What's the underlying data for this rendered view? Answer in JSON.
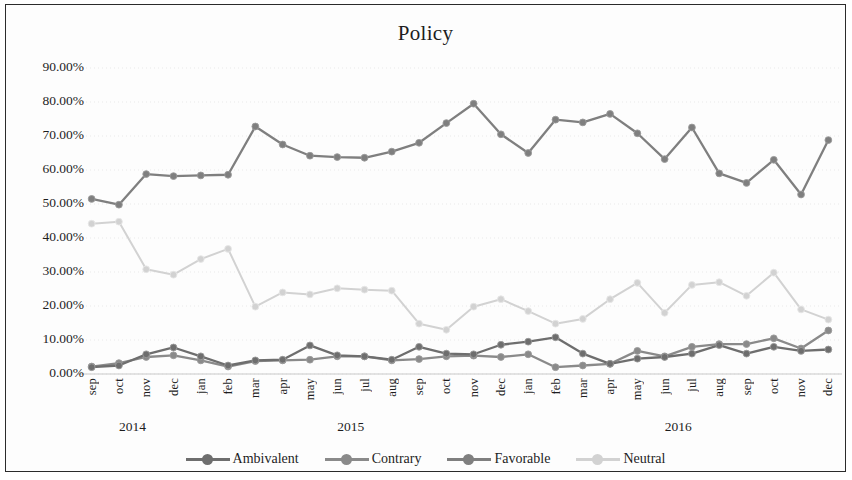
{
  "chart_data": {
    "type": "line",
    "title": "Policy",
    "xlabel": "",
    "ylabel": "",
    "ylim": [
      0,
      90
    ],
    "ytick_labels": [
      "90.00%",
      "80.00%",
      "70.00%",
      "60.00%",
      "50.00%",
      "40.00%",
      "30.00%",
      "20.00%",
      "10.00%",
      "0.00%"
    ],
    "ytick_values": [
      90,
      80,
      70,
      60,
      50,
      40,
      30,
      20,
      10,
      0
    ],
    "grid": true,
    "legend_position": "bottom",
    "categories": [
      "sep",
      "oct",
      "nov",
      "dec",
      "jan",
      "feb",
      "mar",
      "apr",
      "may",
      "jun",
      "jul",
      "aug",
      "sep",
      "oct",
      "nov",
      "dec",
      "jan",
      "feb",
      "mar",
      "apr",
      "may",
      "jun",
      "jul",
      "aug",
      "sep",
      "oct",
      "nov",
      "dec"
    ],
    "year_groups": [
      {
        "label": "2014",
        "start_index": 0,
        "end_index": 3
      },
      {
        "label": "2015",
        "start_index": 4,
        "end_index": 15
      },
      {
        "label": "2016",
        "start_index": 16,
        "end_index": 27
      }
    ],
    "series": [
      {
        "name": "Ambivalent",
        "color": "#6e6e6e",
        "values": [
          2.0,
          2.5,
          5.8,
          7.8,
          5.2,
          2.5,
          4.0,
          4.2,
          8.4,
          5.5,
          5.2,
          4.2,
          8.0,
          6.0,
          5.8,
          8.6,
          9.5,
          10.8,
          6.0,
          3.0,
          4.5,
          5.0,
          6.0,
          8.5,
          6.0,
          8.0,
          6.8,
          7.2
        ]
      },
      {
        "name": "Contrary",
        "color": "#8a8a8a",
        "values": [
          2.2,
          3.2,
          5.0,
          5.5,
          4.0,
          2.2,
          3.8,
          4.0,
          4.2,
          5.2,
          5.2,
          4.0,
          4.4,
          5.2,
          5.4,
          5.0,
          5.8,
          2.0,
          2.5,
          3.0,
          6.8,
          5.2,
          8.0,
          8.8,
          8.8,
          10.5,
          7.5,
          12.8
        ]
      },
      {
        "name": "Favorable",
        "color": "#7f7f7f",
        "values": [
          51.5,
          49.8,
          58.8,
          58.2,
          58.4,
          58.6,
          72.8,
          67.5,
          64.2,
          63.8,
          63.6,
          65.4,
          68.0,
          73.8,
          79.5,
          70.5,
          65.0,
          74.8,
          74.0,
          76.5,
          70.8,
          63.2,
          72.5,
          59.0,
          56.2,
          63.0,
          52.8,
          68.8
        ]
      },
      {
        "name": "Neutral",
        "color": "#d2d2d2",
        "values": [
          44.2,
          44.8,
          30.8,
          29.2,
          33.8,
          36.8,
          19.8,
          24.0,
          23.4,
          25.2,
          24.8,
          24.5,
          14.8,
          13.0,
          19.8,
          22.0,
          18.5,
          14.8,
          16.2,
          22.0,
          26.8,
          18.0,
          26.2,
          27.0,
          23.0,
          29.8,
          19.0,
          16.0
        ]
      }
    ],
    "extra_favorable_last": 65.5,
    "extra_neutral_last": 13.2
  },
  "legend": {
    "items": [
      {
        "label": "Ambivalent"
      },
      {
        "label": "Contrary"
      },
      {
        "label": "Favorable"
      },
      {
        "label": "Neutral"
      }
    ]
  }
}
